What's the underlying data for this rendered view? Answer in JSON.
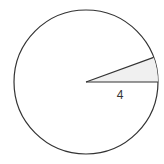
{
  "diagram": {
    "type": "circle-sector",
    "circle": {
      "cx": 86,
      "cy": 82,
      "r": 72,
      "stroke": "#333333",
      "fill": "#ffffff"
    },
    "sector": {
      "start_angle_deg": 0,
      "end_angle_deg": 20,
      "fill": "#f0f0f0",
      "stroke": "#333333"
    },
    "radius_label": "4"
  }
}
